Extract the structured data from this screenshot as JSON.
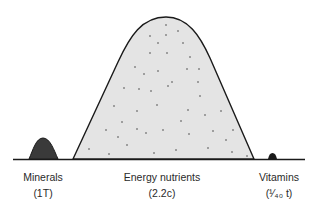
{
  "diagram": {
    "piles": [
      {
        "name": "Minerals",
        "amount": "(1T)"
      },
      {
        "name": "Energy nutrients",
        "amount": "(2.2c)"
      },
      {
        "name": "Vitamins",
        "amount": "(¹⁄₄₀ t)"
      }
    ],
    "colors": {
      "energy_fill": "#e4e4e4",
      "mineral_fill": "#3a3a3a",
      "outline": "#1a1a1a"
    }
  }
}
